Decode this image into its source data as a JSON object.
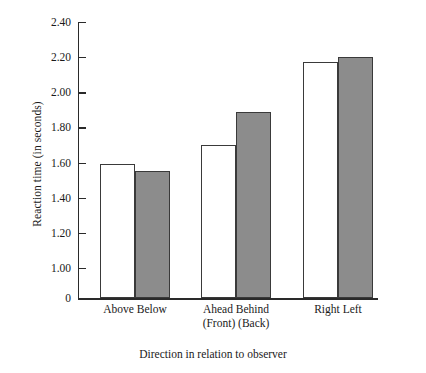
{
  "chart_data": {
    "type": "bar",
    "title": "",
    "xlabel": "Direction in relation to observer",
    "ylabel": "Reaction time  (in seconds)",
    "categories": [
      "Above Below",
      "Ahead Behind",
      "Right Left"
    ],
    "category_sublabels": [
      "",
      "(Front) (Back)",
      ""
    ],
    "series": [
      {
        "name": "first",
        "values": [
          1.59,
          1.7,
          2.17
        ]
      },
      {
        "name": "second",
        "values": [
          1.55,
          1.89,
          2.2
        ]
      }
    ],
    "bar_labels": [
      [
        "Above",
        "Below"
      ],
      [
        "Ahead",
        "Behind"
      ],
      [
        "Right",
        "Left"
      ]
    ],
    "ylim": [
      0.98,
      2.44
    ],
    "axis_break_below": 1.0,
    "yticks": [
      2.4,
      2.2,
      2.0,
      1.8,
      1.6,
      1.4,
      1.2,
      1.0
    ],
    "ytick_labels": [
      "2.40",
      "2.20",
      "2.00",
      "1.80",
      "1.60",
      "1.40",
      "1.20",
      "1.00"
    ],
    "zero_tick_label": "0",
    "grid": false,
    "legend": "none",
    "colors": {
      "series_1_fill": "#ffffff",
      "series_2_fill": "#8c8c8c",
      "outline": "#3a3a3a",
      "axis": "#2a2a2a",
      "text": "#1a1a1a"
    }
  }
}
